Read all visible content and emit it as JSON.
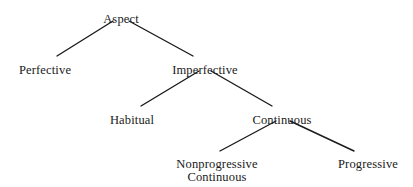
{
  "diagram": {
    "type": "tree",
    "background_color": "#ffffff",
    "line_color": "#1a1a1a",
    "text_color": "#1a1a1a",
    "nodes": [
      {
        "id": "aspect",
        "label": "Aspect",
        "level": 0,
        "x": 121,
        "y": 13
      },
      {
        "id": "perfective",
        "label": "Perfective",
        "level": 1,
        "x": 45,
        "y": 64
      },
      {
        "id": "imperfective",
        "label": "Imperfective",
        "level": 1,
        "x": 205,
        "y": 64
      },
      {
        "id": "habitual",
        "label": "Habitual",
        "level": 2,
        "x": 132,
        "y": 114
      },
      {
        "id": "continuous",
        "label": "Continuous",
        "level": 2,
        "x": 282,
        "y": 114
      },
      {
        "id": "nonprogressive-continuous",
        "label": "Nonprogressive",
        "label_line2": "Continuous",
        "level": 3,
        "x": 217,
        "y": 158
      },
      {
        "id": "progressive",
        "label": "Progressive",
        "level": 3,
        "x": 368,
        "y": 158
      }
    ],
    "edges": [
      {
        "id": "aspect-perfective",
        "from": "aspect",
        "to": "perfective",
        "x1": 113,
        "y1": 21,
        "x2": 57,
        "y2": 56
      },
      {
        "id": "aspect-imperfective",
        "from": "aspect",
        "to": "imperfective",
        "x1": 129,
        "y1": 21,
        "x2": 193,
        "y2": 56
      },
      {
        "id": "imperfective-habitual",
        "from": "imperfective",
        "to": "habitual",
        "x1": 199,
        "y1": 71,
        "x2": 141,
        "y2": 106
      },
      {
        "id": "imperfective-continuous",
        "from": "imperfective",
        "to": "continuous",
        "x1": 211,
        "y1": 71,
        "x2": 272,
        "y2": 106
      },
      {
        "id": "continuous-nonprogressive",
        "from": "continuous",
        "to": "nonprogressive-continuous",
        "x1": 276,
        "y1": 121,
        "x2": 220,
        "y2": 151
      },
      {
        "id": "continuous-progressive",
        "from": "continuous",
        "to": "progressive",
        "x1": 290,
        "y1": 121,
        "x2": 354,
        "y2": 151
      }
    ]
  }
}
